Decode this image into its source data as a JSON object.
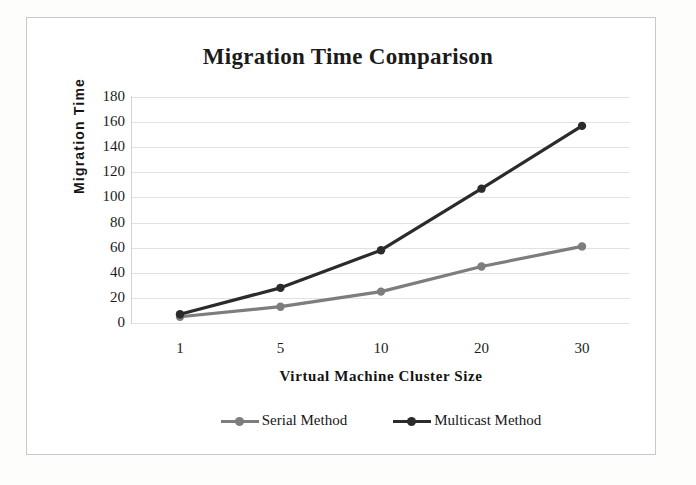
{
  "chart_data": {
    "type": "line",
    "title": "Migration Time Comparison",
    "xlabel": "Virtual Machine  Cluster Size",
    "ylabel": "Migration  Time",
    "categories": [
      "1",
      "5",
      "10",
      "20",
      "30"
    ],
    "x": [
      1,
      5,
      10,
      20,
      30
    ],
    "ylim": [
      0,
      180
    ],
    "yticks": [
      0,
      20,
      40,
      60,
      80,
      100,
      120,
      140,
      160,
      180
    ],
    "ytick_labels": [
      "0",
      "20",
      "40",
      "60",
      "80",
      "100",
      "120",
      "140",
      "160",
      "180"
    ],
    "grid": true,
    "legend_position": "bottom",
    "series": [
      {
        "name": "Serial Method",
        "values": [
          5,
          13,
          25,
          45,
          61
        ],
        "color": "#7d7d7d",
        "marker": "circle"
      },
      {
        "name": "Multicast Method",
        "values": [
          7,
          28,
          58,
          107,
          157
        ],
        "color": "#2b2b2b",
        "marker": "circle"
      }
    ]
  },
  "figure": {
    "frame_color": "#c9c9c9",
    "background": "#ffffff",
    "gridline_color": "#e2e2e2"
  }
}
